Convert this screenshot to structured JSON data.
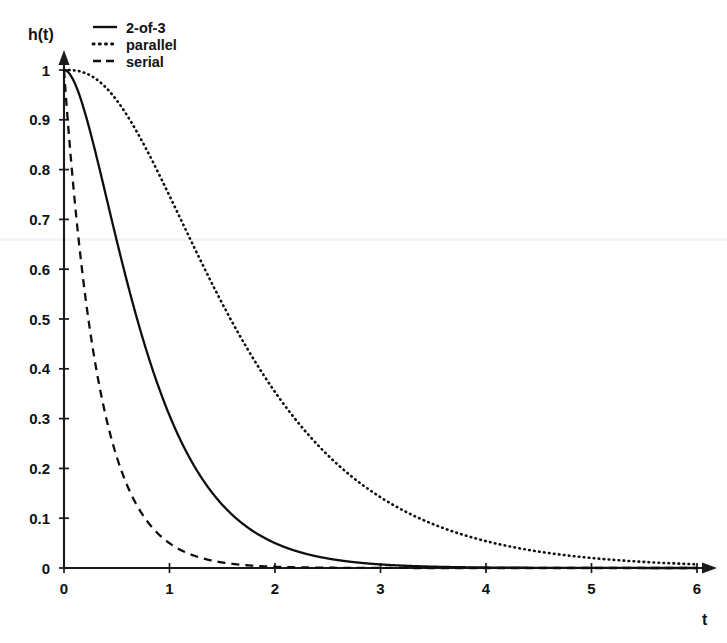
{
  "chart_data": {
    "type": "line",
    "title": "",
    "xlabel": "t",
    "ylabel": "h(t)",
    "xlim": [
      0,
      6
    ],
    "ylim": [
      0,
      1
    ],
    "grid": false,
    "legend_position": "top-left",
    "xticks": [
      "0",
      "1",
      "2",
      "3",
      "4",
      "5",
      "6"
    ],
    "xtick_values": [
      0,
      1,
      2,
      3,
      4,
      5,
      6
    ],
    "yticks": [
      "0",
      "0.1",
      "0.2",
      "0.3",
      "0.4",
      "0.5",
      "0.6",
      "0.7",
      "0.8",
      "0.9",
      "1"
    ],
    "ytick_values": [
      0,
      0.1,
      0.2,
      0.3,
      0.4,
      0.5,
      0.6,
      0.7,
      0.8,
      0.9,
      1
    ],
    "x": [
      0,
      0.1,
      0.2,
      0.3,
      0.4,
      0.5,
      0.6,
      0.7,
      0.8,
      0.9,
      1,
      1.2,
      1.4,
      1.6,
      1.8,
      2,
      2.25,
      2.5,
      2.75,
      3,
      3.25,
      3.5,
      3.75,
      4,
      4.5,
      5,
      5.5,
      6
    ],
    "series": [
      {
        "name": "2-of-3",
        "style": "solid",
        "formula": "3*exp(-2t) - 2*exp(-3t)",
        "values": [
          1.0,
          0.974,
          0.913,
          0.833,
          0.746,
          0.657,
          0.572,
          0.493,
          0.421,
          0.357,
          0.302,
          0.217,
          0.152,
          0.106,
          0.073,
          0.05,
          0.031,
          0.02,
          0.012,
          0.0073,
          0.0045,
          0.0027,
          0.0017,
          0.001,
          0.0004,
          0.0001,
          5e-05,
          2e-05
        ]
      },
      {
        "name": "parallel",
        "style": "dotted",
        "formula": "1 - (1 - exp(-t))^3",
        "values": [
          1.0,
          0.999,
          0.994,
          0.985,
          0.971,
          0.952,
          0.929,
          0.902,
          0.871,
          0.838,
          0.803,
          0.727,
          0.65,
          0.574,
          0.502,
          0.436,
          0.363,
          0.3,
          0.246,
          0.2,
          0.163,
          0.132,
          0.106,
          0.086,
          0.055,
          0.035,
          0.022,
          0.014
        ]
      },
      {
        "name": "serial",
        "style": "dashed",
        "formula": "exp(-3t)",
        "values": [
          1.0,
          0.741,
          0.549,
          0.407,
          0.301,
          0.223,
          0.165,
          0.122,
          0.091,
          0.067,
          0.05,
          0.027,
          0.015,
          0.0082,
          0.0045,
          0.0025,
          0.0011,
          0.00055,
          0.00026,
          0.00012,
          6e-05,
          3e-05,
          1e-05,
          6e-06,
          1.4e-06,
          3e-07,
          7e-08,
          2e-08
        ]
      }
    ]
  },
  "legend": {
    "entries": [
      {
        "label": "2-of-3",
        "style": "solid"
      },
      {
        "label": "parallel",
        "style": "dotted"
      },
      {
        "label": "serial",
        "style": "dashed"
      }
    ]
  },
  "axes": {
    "y_axis_title": "h(t)",
    "x_axis_title": "t"
  }
}
